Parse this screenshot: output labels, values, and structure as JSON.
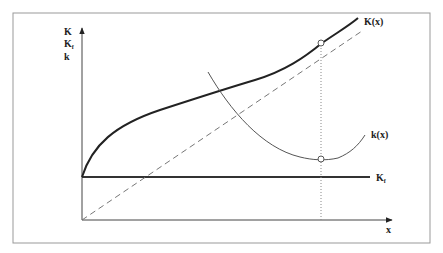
{
  "diagram": {
    "y_axis_labels": [
      "K",
      "K",
      "k"
    ],
    "y_axis_label_subscript": "f",
    "x_axis_label": "x",
    "curves": {
      "K": {
        "label": "K(x)",
        "color": "#222222"
      },
      "k": {
        "label": "k(x)",
        "color": "#555555"
      },
      "Kf": {
        "label": "K",
        "subscript": "f",
        "color": "#333333"
      },
      "tangent": {
        "style": "dashed",
        "color": "#777777"
      },
      "vertical": {
        "style": "dotted",
        "color": "#888888"
      }
    },
    "colors": {
      "frame": "#888888",
      "axes": "#444444"
    }
  }
}
